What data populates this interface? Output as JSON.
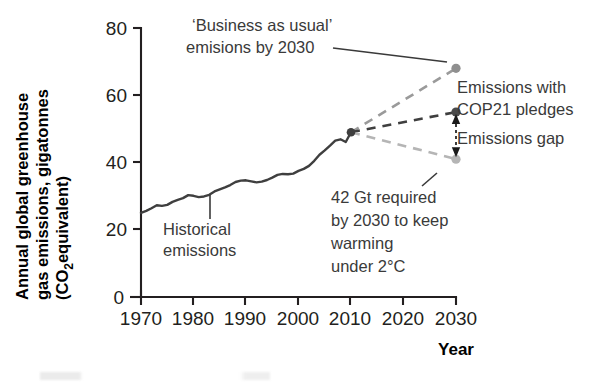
{
  "chart_data": {
    "type": "line",
    "title": "",
    "xlabel": "Year",
    "ylabel": "Annual global greenhouse gas emissions, gigatonnes (CO₂equivalent)",
    "ylabel_line1": "Annual global greenhouse",
    "ylabel_line2": "gas emissions, gigatonnes",
    "ylabel_line3_pre": "(CO",
    "ylabel_line3_sub": "2",
    "ylabel_line3_post": "equivalent)",
    "xlim": [
      1968,
      2032
    ],
    "ylim": [
      0,
      80
    ],
    "grid": false,
    "legend": "none",
    "xticks": [
      "1970",
      "1980",
      "1990",
      "2000",
      "2010",
      "2020",
      "2030"
    ],
    "xtick_values": [
      1970,
      1980,
      1990,
      2000,
      2010,
      2020,
      2030
    ],
    "yticks": [
      "0",
      "20",
      "40",
      "60",
      "80"
    ],
    "ytick_values": [
      0,
      20,
      40,
      60,
      80
    ],
    "series": [
      {
        "name": "Historical emissions",
        "style": "solid",
        "color": "#3f3f3f",
        "x": [
          1970,
          1971,
          1972,
          1973,
          1974,
          1975,
          1976,
          1977,
          1978,
          1979,
          1980,
          1981,
          1982,
          1983,
          1984,
          1985,
          1986,
          1987,
          1988,
          1989,
          1990,
          1991,
          1992,
          1993,
          1994,
          1995,
          1996,
          1997,
          1998,
          1999,
          2000,
          2001,
          2002,
          2003,
          2004,
          2005,
          2006,
          2007,
          2008,
          2009,
          2010
        ],
        "values": [
          25.0,
          25.6,
          26.4,
          27.3,
          27.1,
          27.4,
          28.3,
          28.9,
          29.4,
          30.3,
          30.1,
          29.7,
          29.9,
          30.4,
          31.4,
          32.0,
          32.6,
          33.3,
          34.2,
          34.6,
          34.7,
          34.4,
          34.1,
          34.3,
          34.8,
          35.5,
          36.3,
          36.6,
          36.5,
          36.7,
          37.5,
          38.1,
          39.0,
          40.5,
          42.3,
          43.6,
          45.0,
          46.5,
          46.9,
          46.1,
          49.0
        ]
      },
      {
        "name": "'Business as usual' emisions by 2030",
        "style": "dashed",
        "color": "#9a9a9a",
        "x": [
          2010,
          2030
        ],
        "values": [
          49.0,
          68.0
        ],
        "endpoint_value": 68.0
      },
      {
        "name": "Emissions with COP21 pledges",
        "style": "dashed",
        "color": "#3f3f3f",
        "x": [
          2010,
          2030
        ],
        "values": [
          49.0,
          55.0
        ],
        "endpoint_value": 55.0
      },
      {
        "name": "42 Gt required by 2030 to keep warming under 2°C",
        "style": "dashed",
        "color": "#b5b5b5",
        "x": [
          2010,
          2030
        ],
        "values": [
          49.0,
          41.0
        ],
        "endpoint_value": 41.0
      }
    ],
    "annotations": [
      {
        "id": "bau",
        "lines": [
          "‘Business as usual’",
          "emisions by 2030"
        ],
        "target_x": 2030,
        "target_y": 68.0
      },
      {
        "id": "historical",
        "lines": [
          "Historical",
          "emissions"
        ],
        "target_x": 1993,
        "target_y": 34.5
      },
      {
        "id": "cop21",
        "lines": [
          "Emissions with",
          "COP21 pledges"
        ],
        "target_x": 2030,
        "target_y": 55.0
      },
      {
        "id": "gap",
        "lines": [
          "Emissions gap"
        ],
        "span_from": 41.0,
        "span_to": 55.0
      },
      {
        "id": "target2c",
        "lines": [
          "42 Gt required",
          "by 2030 to keep",
          "warming",
          "under 2°C"
        ],
        "target_x": 2030,
        "target_y": 41.0
      }
    ]
  },
  "axis": {
    "x_title": "Year"
  },
  "colors": {
    "historical": "#3f3f3f",
    "bau": "#9a9a9a",
    "cop21": "#3f3f3f",
    "target": "#b5b5b5",
    "axis": "#231f20",
    "text": "#3a3a3a",
    "background": "#ffffff"
  }
}
